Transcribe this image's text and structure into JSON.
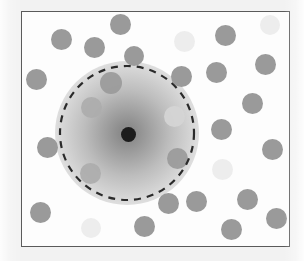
{
  "figure": {
    "width": 304,
    "height": 261,
    "background_color": "#f2f2f2",
    "panel_background_color": "#fdfdfd"
  },
  "frame": {
    "name": "plot-frame",
    "x": 21,
    "y": 11,
    "width": 269,
    "height": 236,
    "border_color": "#5a5a5a",
    "border_width": 1.6
  },
  "halo": {
    "name": "concentration-gradient",
    "center_x": 126,
    "center_y": 132,
    "radius": 72,
    "inner_color": "#8c8c8c",
    "mid_color": "#bdbdbd",
    "outer_color": "#ffffff"
  },
  "boundary": {
    "name": "dashed-boundary-circle",
    "center_x": 126,
    "center_y": 132,
    "radius": 67,
    "stroke_color": "#2b2b2b",
    "stroke_width": 2.2,
    "dash": "7 6",
    "style": "dashed"
  },
  "source": {
    "name": "source-point",
    "center_x": 127,
    "center_y": 133,
    "radius": 7.5,
    "color": "#1c1c1c"
  },
  "palette": {
    "dot_gray": "#9a9a9a",
    "dot_gray_mid": "#a6a6a6",
    "dot_light": "#ededed",
    "dot_faint": "#d5d5d5",
    "dot_inside_soft": "#adadad",
    "source_dark": "#1c1c1c",
    "boundary_stroke": "#2b2b2b",
    "frame_stroke": "#5a5a5a"
  },
  "chart_data": {
    "type": "scatter",
    "subtitle": "",
    "xlabel": "",
    "ylabel": "",
    "xlim": [
      0,
      269
    ],
    "ylim": [
      0,
      236
    ],
    "grid": false,
    "legend": null,
    "annotations": [
      {
        "kind": "radial-gradient-halo",
        "label": "concentration-gradient",
        "cx": 126,
        "cy": 132,
        "r": 72
      },
      {
        "kind": "dashed-circle",
        "label": "influence-boundary",
        "cx": 126,
        "cy": 132,
        "r": 67
      },
      {
        "kind": "point",
        "label": "source-point",
        "cx": 127,
        "cy": 133,
        "r": 7.5
      }
    ],
    "series": [
      {
        "name": "particles",
        "marker": "circle",
        "points": [
          {
            "cx": 119,
            "cy": 23,
            "r": 10.5,
            "shade": "gray",
            "inside_boundary": false
          },
          {
            "cx": 60,
            "cy": 38,
            "r": 10.5,
            "shade": "gray",
            "inside_boundary": false
          },
          {
            "cx": 93,
            "cy": 46,
            "r": 10.5,
            "shade": "gray",
            "inside_boundary": false
          },
          {
            "cx": 183,
            "cy": 40,
            "r": 10.5,
            "shade": "light",
            "inside_boundary": false
          },
          {
            "cx": 224,
            "cy": 34,
            "r": 10.5,
            "shade": "gray",
            "inside_boundary": false
          },
          {
            "cx": 269,
            "cy": 24,
            "r": 10.0,
            "shade": "light",
            "inside_boundary": false
          },
          {
            "cx": 133,
            "cy": 55,
            "r": 10.0,
            "shade": "gray",
            "inside_boundary": false
          },
          {
            "cx": 35,
            "cy": 78,
            "r": 10.5,
            "shade": "gray",
            "inside_boundary": false
          },
          {
            "cx": 264,
            "cy": 63,
            "r": 10.5,
            "shade": "gray",
            "inside_boundary": false
          },
          {
            "cx": 110,
            "cy": 82,
            "r": 11.0,
            "shade": "gray",
            "inside_boundary": true
          },
          {
            "cx": 180,
            "cy": 75,
            "r": 10.5,
            "shade": "gray",
            "inside_boundary": false
          },
          {
            "cx": 215,
            "cy": 71,
            "r": 10.5,
            "shade": "gray",
            "inside_boundary": false
          },
          {
            "cx": 90,
            "cy": 106,
            "r": 10.5,
            "shade": "inside_soft",
            "inside_boundary": true
          },
          {
            "cx": 173,
            "cy": 115,
            "r": 10.5,
            "shade": "faint",
            "inside_boundary": true
          },
          {
            "cx": 251,
            "cy": 102,
            "r": 10.5,
            "shade": "gray",
            "inside_boundary": false
          },
          {
            "cx": 46,
            "cy": 146,
            "r": 10.5,
            "shade": "gray",
            "inside_boundary": false
          },
          {
            "cx": 220,
            "cy": 128,
            "r": 10.5,
            "shade": "gray",
            "inside_boundary": false
          },
          {
            "cx": 271,
            "cy": 148,
            "r": 10.5,
            "shade": "gray",
            "inside_boundary": false
          },
          {
            "cx": 176,
            "cy": 157,
            "r": 10.5,
            "shade": "gray",
            "inside_boundary": true
          },
          {
            "cx": 89,
            "cy": 172,
            "r": 10.5,
            "shade": "inside_soft",
            "inside_boundary": true
          },
          {
            "cx": 221,
            "cy": 168,
            "r": 10.5,
            "shade": "light",
            "inside_boundary": false
          },
          {
            "cx": 39,
            "cy": 211,
            "r": 10.5,
            "shade": "gray",
            "inside_boundary": false
          },
          {
            "cx": 167,
            "cy": 202,
            "r": 10.5,
            "shade": "gray",
            "inside_boundary": false
          },
          {
            "cx": 195,
            "cy": 200,
            "r": 10.5,
            "shade": "gray",
            "inside_boundary": false
          },
          {
            "cx": 246,
            "cy": 198,
            "r": 10.5,
            "shade": "gray",
            "inside_boundary": false
          },
          {
            "cx": 275,
            "cy": 217,
            "r": 10.5,
            "shade": "gray",
            "inside_boundary": false
          },
          {
            "cx": 90,
            "cy": 227,
            "r": 10.0,
            "shade": "light",
            "inside_boundary": false
          },
          {
            "cx": 143,
            "cy": 225,
            "r": 10.5,
            "shade": "gray",
            "inside_boundary": false
          },
          {
            "cx": 230,
            "cy": 228,
            "r": 10.5,
            "shade": "gray",
            "inside_boundary": false
          }
        ]
      }
    ]
  }
}
